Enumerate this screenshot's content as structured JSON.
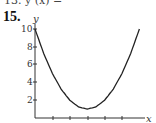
{
  "problem": {
    "number": "15.",
    "top_cut_text": "13. y (x) ="
  },
  "chart_data": {
    "type": "line",
    "title": "",
    "xlabel": "x",
    "ylabel": "y",
    "y_ticks": [
      "2",
      "4",
      "6",
      "8",
      "10"
    ],
    "x_ticks_unlabeled": [
      1,
      2,
      3,
      4,
      5
    ],
    "x": [
      0,
      0.5,
      1,
      1.5,
      2,
      2.5,
      3,
      3.5,
      4,
      4.5,
      5,
      5.5,
      6
    ],
    "values": [
      10,
      7.25,
      5,
      3.25,
      2,
      1.25,
      1,
      1.25,
      2,
      3.25,
      5,
      7.25,
      10
    ],
    "xlim": [
      0,
      6.5
    ],
    "ylim": [
      0,
      10.5
    ],
    "grid": false,
    "minimum": {
      "x": 3,
      "y": 1
    }
  }
}
